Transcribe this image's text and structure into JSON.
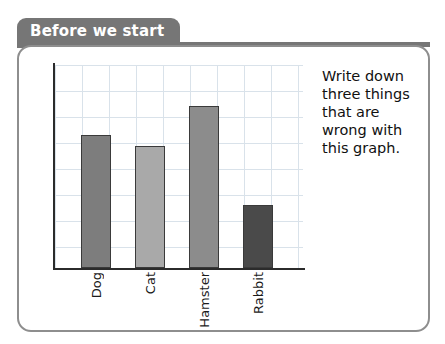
{
  "header": {
    "tab_label": "Before we start"
  },
  "instruction": {
    "text": "Write down three things that are wrong with this graph."
  },
  "colors": {
    "tab_background": "#767676",
    "tab_text": "#ffffff",
    "card_border": "#8e8e8e",
    "card_background": "#ffffff",
    "grid_line": "#d9e2ea",
    "axis": "#2b2b2b",
    "bar_outline": "#3a3a3a"
  },
  "chart_data": {
    "type": "bar",
    "title": "",
    "xlabel": "",
    "ylabel": "",
    "categories": [
      "Dog",
      "Cat",
      "Hamster",
      "Rabbit"
    ],
    "values": [
      7.2,
      6.6,
      8.8,
      3.4
    ],
    "ylim": [
      0,
      11
    ],
    "grid": true,
    "legend": "none",
    "tick_labels_rotated": true,
    "bar_colors": [
      "#7d7d7d",
      "#a9a9a9",
      "#8c8c8c",
      "#4a4a4a"
    ],
    "annotations": [],
    "notes_visible_in_image": []
  }
}
